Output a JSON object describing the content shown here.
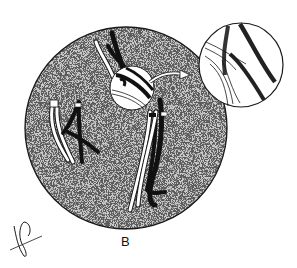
{
  "figure": {
    "panel_label": "B",
    "signature": "Ken",
    "colors": {
      "background": "#ffffff",
      "cell_fill": "#b9b9b9",
      "outline": "#1a1a1a",
      "dark_chromosome": "#111111",
      "light_chromosome": "#ffffff"
    },
    "elements": [
      {
        "name": "cell",
        "shape": "circle",
        "stippled": true
      },
      {
        "name": "magnifier-circle",
        "shape": "circle",
        "location": "upper-center of cell"
      },
      {
        "name": "inset-circle",
        "shape": "circle",
        "location": "upper-right, outside cell"
      },
      {
        "name": "arrow",
        "from": "magnifier-circle",
        "to": "inset-circle"
      },
      {
        "name": "chromosome-pair-left",
        "type": "light and dark chromatids"
      },
      {
        "name": "chromosome-pair-center",
        "type": "crossed light and dark chromatids"
      }
    ]
  }
}
